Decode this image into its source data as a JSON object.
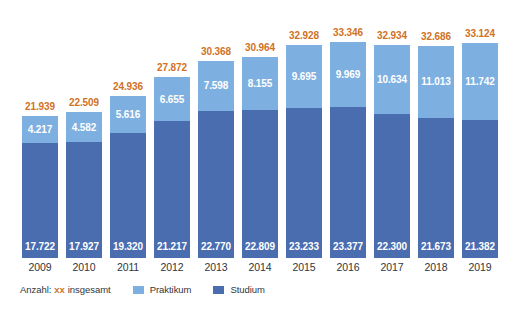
{
  "chart_data": {
    "type": "bar",
    "title": "",
    "subtitle": "",
    "xlabel": "",
    "ylabel": "",
    "stacked": true,
    "grid": false,
    "legend_position": "bottom-left",
    "ylim": [
      0,
      33346
    ],
    "categories": [
      "2009",
      "2010",
      "2011",
      "2012",
      "2013",
      "2014",
      "2015",
      "2016",
      "2017",
      "2018",
      "2019"
    ],
    "series": [
      {
        "name": "Studium",
        "color": "#4a6db0",
        "values": [
          17722,
          17927,
          19320,
          21217,
          22770,
          22809,
          23233,
          23377,
          22300,
          21673,
          21382
        ],
        "labels": [
          "17.722",
          "17.927",
          "19.320",
          "21.217",
          "22.770",
          "22.809",
          "23.233",
          "23.377",
          "22.300",
          "21.673",
          "21.382"
        ]
      },
      {
        "name": "Praktikum",
        "color": "#7db0e0",
        "values": [
          4217,
          4582,
          5616,
          6655,
          7598,
          8155,
          9695,
          9969,
          10634,
          11013,
          11742
        ],
        "labels": [
          "4.217",
          "4.582",
          "5.616",
          "6.655",
          "7.598",
          "8.155",
          "9.695",
          "9.969",
          "10.634",
          "11.013",
          "11.742"
        ]
      }
    ],
    "totals": [
      21939,
      22509,
      24936,
      27872,
      30368,
      30964,
      32928,
      33346,
      32934,
      32686,
      33124
    ],
    "total_labels": [
      "21.939",
      "22.509",
      "24.936",
      "27.872",
      "30.368",
      "30.964",
      "32.928",
      "33.346",
      "32.934",
      "32.686",
      "33.124"
    ],
    "total_label_color": "#cf7226"
  },
  "legend": {
    "prefix": "Anzahl:",
    "xx_token": "xx",
    "xx_description": "insgesamt",
    "entries": [
      {
        "label": "Praktikum",
        "color": "#7db0e0"
      },
      {
        "label": "Studium",
        "color": "#4a6db0"
      }
    ]
  },
  "colors": {
    "background": "#ffffff",
    "light_blue": "#7db0e0",
    "dark_blue": "#4a6db0",
    "orange": "#cf7226",
    "axis_text": "#32353a"
  }
}
